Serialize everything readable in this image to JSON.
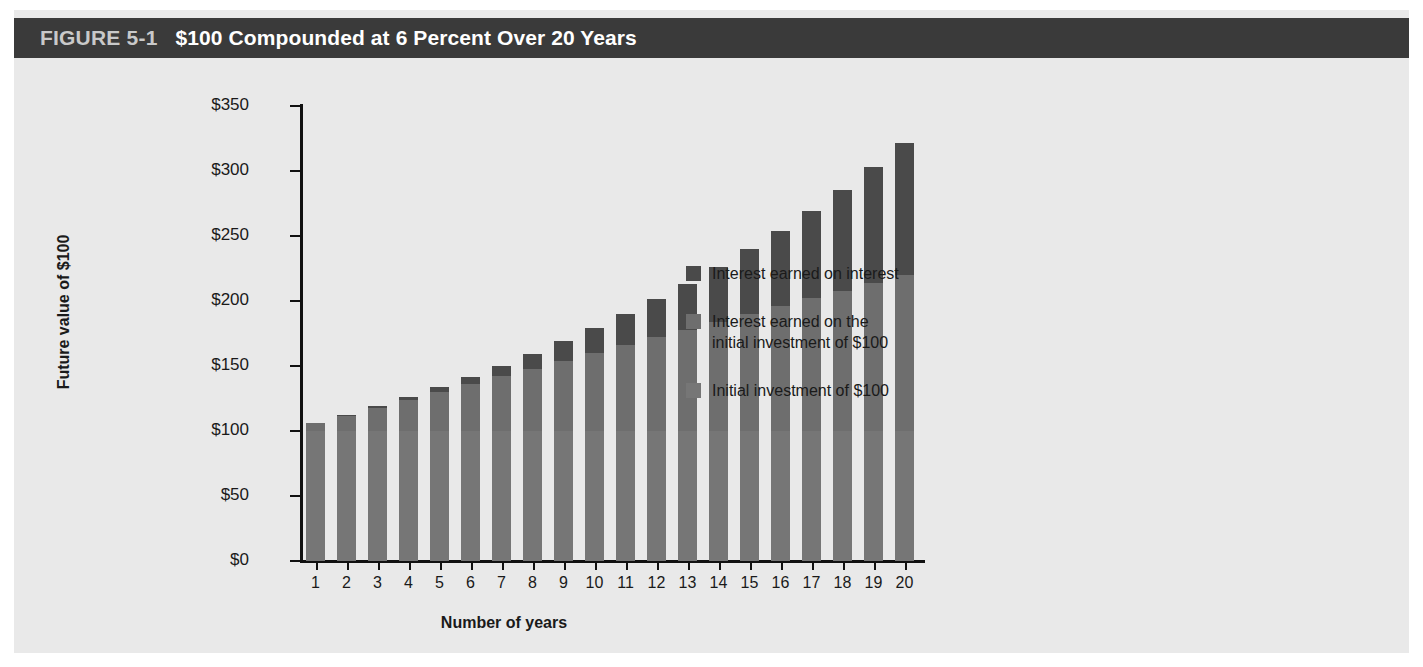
{
  "figure": {
    "number": "FIGURE 5-1",
    "title": "$100 Compounded at 6 Percent Over 20 Years"
  },
  "colors": {
    "panel_background": "#e9e9e9",
    "title_bar": "#3a3a3a",
    "title_number_text": "#c9c9c9",
    "title_text": "#ffffff",
    "interest_on_interest": "#4a4a4a",
    "interest_on_initial": "#6e6e6e",
    "initial_investment": "#767676",
    "axis": "#111111"
  },
  "legend": {
    "position": "right",
    "items": [
      {
        "label": "Interest earned on interest",
        "color": "#4a4a4a"
      },
      {
        "label": "Interest earned on the\ninitial investment of $100",
        "color": "#6e6e6e"
      },
      {
        "label": "Initial investment of $100",
        "color": "#767676"
      }
    ]
  },
  "chart_data": {
    "type": "bar",
    "stacked": true,
    "title": "$100 Compounded at 6 Percent Over 20 Years",
    "xlabel": "Number of years",
    "ylabel": "Future value of $100",
    "ylim": [
      0,
      350
    ],
    "yticks": [
      0,
      50,
      100,
      150,
      200,
      250,
      300,
      350
    ],
    "ytick_labels": [
      "$0",
      "$50",
      "$100",
      "$150",
      "$200",
      "$250",
      "$300",
      "$350"
    ],
    "xlim": [
      0,
      21
    ],
    "grid": false,
    "legend_position": "right",
    "categories": [
      1,
      2,
      3,
      4,
      5,
      6,
      7,
      8,
      9,
      10,
      11,
      12,
      13,
      14,
      15,
      16,
      17,
      18,
      19,
      20
    ],
    "xtick_labels": [
      "1",
      "2",
      "3",
      "4",
      "5",
      "6",
      "7",
      "8",
      "9",
      "10",
      "11",
      "12",
      "13",
      "14",
      "15",
      "16",
      "17",
      "18",
      "19",
      "20"
    ],
    "series": [
      {
        "name": "Initial investment of $100",
        "color": "#767676",
        "values": [
          100,
          100,
          100,
          100,
          100,
          100,
          100,
          100,
          100,
          100,
          100,
          100,
          100,
          100,
          100,
          100,
          100,
          100,
          100,
          100
        ]
      },
      {
        "name": "Interest earned on the initial investment of $100",
        "color": "#6e6e6e",
        "values": [
          6,
          12,
          18,
          24,
          30,
          36,
          42,
          48,
          54,
          60,
          66,
          72,
          78,
          84,
          90,
          96,
          102,
          108,
          114,
          120
        ]
      },
      {
        "name": "Interest earned on interest",
        "color": "#4a4a4a",
        "values": [
          0.0,
          0.36,
          1.1,
          2.25,
          3.82,
          5.85,
          8.36,
          11.38,
          14.95,
          19.08,
          23.84,
          29.24,
          35.33,
          42.16,
          49.77,
          58.2,
          67.52,
          77.76,
          88.99,
          101.26
        ]
      }
    ],
    "totals": [
      106.0,
      112.36,
      119.1,
      126.25,
      133.82,
      141.85,
      150.36,
      159.38,
      168.95,
      179.08,
      189.83,
      201.22,
      213.29,
      226.09,
      239.66,
      254.04,
      269.28,
      285.43,
      302.56,
      320.71
    ],
    "totals_labels": [
      "$106.00",
      "$112.36",
      "$119.10",
      "$126.25",
      "$133.82",
      "$141.85",
      "$150.36",
      "$159.38",
      "$168.95",
      "$179.08",
      "$189.83",
      "$201.22",
      "$213.29",
      "$226.09",
      "$239.66",
      "$254.04",
      "$269.28",
      "$285.43",
      "$302.56",
      "$320.71"
    ]
  }
}
